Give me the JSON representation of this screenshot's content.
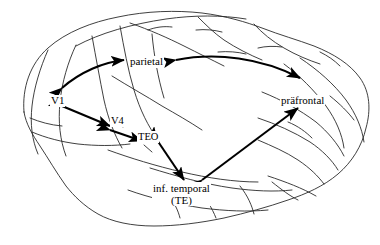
{
  "figure": {
    "type": "diagram",
    "background_color": "#ffffff",
    "line_color": "#000000"
  },
  "labels": {
    "parietal": "parietal",
    "v1": "V1",
    "v4": "V4",
    "teo": "TEO",
    "inf_temporal_line1": "inf. temporal",
    "inf_temporal_line2": "(TE)",
    "praefrontal": "präfrontal"
  },
  "regions": [
    {
      "name": "parietal",
      "label": "parietal",
      "x": 129,
      "y": 56
    },
    {
      "name": "v1",
      "label": "V1",
      "x": 50,
      "y": 95
    },
    {
      "name": "v4",
      "label": "V4",
      "x": 110,
      "y": 115
    },
    {
      "name": "teo",
      "label": "TEO",
      "x": 137,
      "y": 131
    },
    {
      "name": "inferior-temporal",
      "label": "inf. temporal (TE)",
      "x": 152,
      "y": 182
    },
    {
      "name": "praefrontal",
      "label": "präfrontal",
      "x": 280,
      "y": 95
    }
  ],
  "connections": [
    {
      "from": "v1",
      "to": "parietal",
      "style": "double-headed-curved"
    },
    {
      "from": "parietal",
      "to": "praefrontal",
      "style": "double-headed-curved"
    },
    {
      "from": "v1",
      "to": "v4",
      "style": "double-headed-straight"
    },
    {
      "from": "v4",
      "to": "teo",
      "style": "double-headed-straight"
    },
    {
      "from": "teo",
      "to": "inferior-temporal",
      "style": "double-headed-straight"
    },
    {
      "from": "inferior-temporal",
      "to": "praefrontal",
      "style": "double-headed-straight"
    }
  ]
}
